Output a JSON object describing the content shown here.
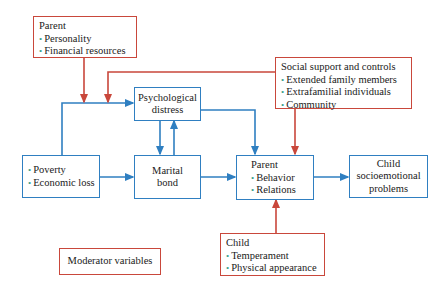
{
  "colors": {
    "blue": "#2f7fc1",
    "red": "#c9473b",
    "bullet": "#3aa08a"
  },
  "boxes": {
    "parent_mod": {
      "title": "Parent",
      "items": [
        "Personality",
        "Financial resources"
      ]
    },
    "social": {
      "title": "Social support and controls",
      "items": [
        "Extended family members",
        "Extrafamilial individuals",
        "Community"
      ]
    },
    "psych": {
      "line1": "Psychological",
      "line2": "distress"
    },
    "poverty": {
      "items": [
        "Poverty",
        "Economic loss"
      ]
    },
    "marital": {
      "line1": "Marital",
      "line2": "bond"
    },
    "parent": {
      "title": "Parent",
      "items": [
        "Behavior",
        "Relations"
      ]
    },
    "child_out": {
      "line1": "Child",
      "line2": "socioemotional",
      "line3": "problems"
    },
    "child_mod": {
      "title": "Child",
      "items": [
        "Temperament",
        "Physical appearance"
      ]
    },
    "legend": {
      "label": "Moderator variables"
    }
  },
  "bullet_glyph": "•"
}
